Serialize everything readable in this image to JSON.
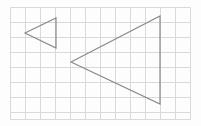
{
  "figure": {
    "title": "Two nested left-pointing triangles on a square grid",
    "canvas": {
      "width": 201,
      "height": 126,
      "background_color": "#fdfdfd"
    },
    "grid": {
      "name": "square-grid",
      "origin_x": 10,
      "origin_y": 7,
      "cell_size": 15,
      "columns": 12,
      "rows": 7.5,
      "right_edge": 190,
      "bottom_edge": 119,
      "line_color": "#d9d9d9",
      "line_width": 1,
      "visible": true,
      "x_lines": [
        10,
        25,
        40,
        55,
        70,
        85,
        100,
        115,
        130,
        145,
        160,
        175,
        190
      ],
      "y_lines": [
        7,
        22,
        37,
        52,
        67,
        82,
        97,
        112,
        119
      ]
    },
    "shapes": [
      {
        "name": "small-triangle",
        "label": "Small left-pointing triangle",
        "type": "triangle",
        "orientation": "left-pointing",
        "stroke_color": "#8a8a8a",
        "stroke_width": 1.2,
        "fill": "none",
        "vertices": [
          {
            "label": "apex-left",
            "x": 25,
            "y": 33
          },
          {
            "label": "top-right",
            "x": 56,
            "y": 18
          },
          {
            "label": "bottom-right",
            "x": 56,
            "y": 48
          }
        ],
        "base_length_px": 30,
        "height_px": 31
      },
      {
        "name": "large-triangle",
        "label": "Large left-pointing triangle",
        "type": "triangle",
        "orientation": "left-pointing",
        "stroke_color": "#8a8a8a",
        "stroke_width": 1.2,
        "fill": "none",
        "vertices": [
          {
            "label": "apex-left",
            "x": 71,
            "y": 62
          },
          {
            "label": "top-right",
            "x": 160,
            "y": 16
          },
          {
            "label": "bottom-right",
            "x": 160,
            "y": 104
          }
        ],
        "base_length_px": 88,
        "height_px": 89
      }
    ]
  }
}
